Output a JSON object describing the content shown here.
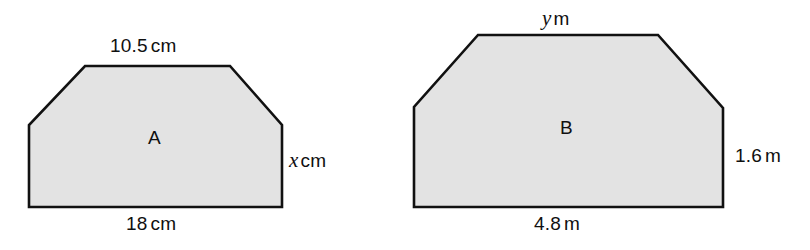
{
  "figure": {
    "background_color": "#ffffff",
    "shape_fill_color": "#e3e3e3",
    "shape_stroke_color": "#111111"
  },
  "shapes": [
    {
      "id": "A",
      "name_label": "A",
      "points": "85,66 230,66 282,125 282,207 29,207 29,125",
      "labels": {
        "top": {
          "value": "10.5",
          "unit": "cm"
        },
        "bottom": {
          "value": "18",
          "unit": "cm"
        },
        "right": {
          "value": "x",
          "unit": "cm",
          "is_variable": true
        }
      }
    },
    {
      "id": "B",
      "name_label": "B",
      "points": "478,35 658,35 723,108 723,207 414,207 414,107",
      "labels": {
        "top": {
          "value": "y",
          "unit": "m",
          "is_variable": true
        },
        "bottom": {
          "value": "4.8",
          "unit": "m"
        },
        "right": {
          "value": "1.6",
          "unit": "m"
        }
      }
    }
  ],
  "text": {
    "a_top_number": "10.5",
    "a_top_unit": "cm",
    "a_bottom_number": "18",
    "a_bottom_unit": "cm",
    "a_right_var": "x",
    "a_right_unit": "cm",
    "a_name": "A",
    "b_top_var": "y",
    "b_top_unit": "m",
    "b_bottom_number": "4.8",
    "b_bottom_unit": "m",
    "b_right_number": "1.6",
    "b_right_unit": "m",
    "b_name": "B"
  }
}
